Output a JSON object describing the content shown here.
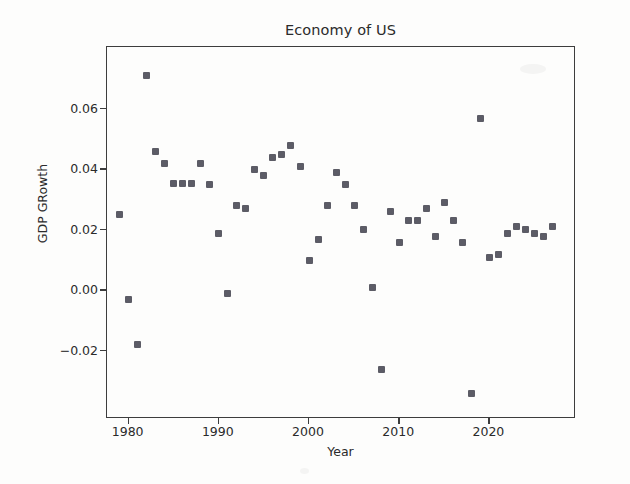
{
  "chart_data": {
    "type": "scatter",
    "title": "Economy of US",
    "xlabel": "Year",
    "ylabel": "GDP GRowth",
    "grid": false,
    "legend": false,
    "xlim": [
      1977.6,
      2029.6
    ],
    "ylim": [
      -0.0425,
      0.0805
    ],
    "xticks": [
      1980,
      1990,
      2000,
      2010,
      2020
    ],
    "xtick_labels": [
      "1980",
      "1990",
      "2000",
      "2010",
      "2020"
    ],
    "yticks": [
      -0.02,
      0.0,
      0.02,
      0.04,
      0.06
    ],
    "ytick_labels": [
      "-0.02",
      "0.00",
      "0.02",
      "0.04",
      "0.06"
    ],
    "marker": "x-square",
    "marker_color": "#5c5c66",
    "x": [
      1979,
      1980,
      1981,
      1982,
      1983,
      1984,
      1985,
      1986,
      1987,
      1988,
      1989,
      1990,
      1991,
      1992,
      1993,
      1994,
      1995,
      1996,
      1997,
      1998,
      1999,
      2000,
      2001,
      2002,
      2003,
      2004,
      2005,
      2006,
      2007,
      2008,
      2009,
      2010,
      2011,
      2012,
      2013,
      2014,
      2015,
      2016,
      2017,
      2018,
      2019,
      2020,
      2021,
      2022,
      2023,
      2024,
      2025,
      2026,
      2027
    ],
    "y": [
      0.025,
      -0.003,
      -0.018,
      0.071,
      0.046,
      0.042,
      0.0355,
      0.0355,
      0.0355,
      0.042,
      0.035,
      0.019,
      -0.001,
      0.028,
      0.027,
      0.04,
      0.038,
      0.044,
      0.045,
      0.048,
      0.041,
      0.01,
      0.017,
      0.028,
      0.039,
      0.035,
      0.028,
      0.02,
      0.001,
      -0.026,
      0.026,
      0.016,
      0.023,
      0.023,
      0.027,
      0.018,
      0.029,
      0.023,
      0.016,
      -0.034,
      0.057,
      0.011,
      0.012,
      0.019,
      0.021,
      0.02,
      0.019,
      0.018,
      0.021
    ]
  },
  "figure": {
    "title": "Economy of US",
    "x_axis_label": "Year",
    "y_axis_label": "GDP GRowth"
  }
}
